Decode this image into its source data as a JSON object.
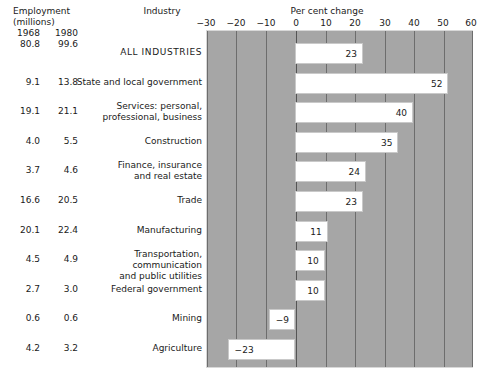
{
  "header": {
    "employment_title": "Employment\n(millions)",
    "industry_title": "Industry",
    "percent_title": "Per cent change",
    "year_a": "1968",
    "year_b": "1980",
    "total_a": "80.8",
    "total_b": "99.6"
  },
  "chart_data": {
    "type": "bar",
    "orientation": "horizontal",
    "title": "Per cent change",
    "xlabel": "Per cent change",
    "ylabel": "Industry",
    "xlim": [
      -30,
      60
    ],
    "xticks": [
      -30,
      -20,
      -10,
      0,
      10,
      20,
      30,
      40,
      50,
      60
    ],
    "xtick_labels": [
      "−30",
      "−20",
      "−10",
      "0",
      "10",
      "20",
      "30",
      "40",
      "50",
      "60"
    ],
    "grid": true,
    "legend": "none",
    "categories": [
      "ALL INDUSTRIES",
      "State and local government",
      "Services: personal,\nprofessional, business",
      "Construction",
      "Finance, insurance\nand real estate",
      "Trade",
      "Manufacturing",
      "Transportation, communication\nand public utilities",
      "Federal government",
      "Mining",
      "Agriculture"
    ],
    "values": [
      23,
      52,
      40,
      35,
      24,
      23,
      11,
      10,
      10,
      -9,
      -23
    ],
    "value_labels": [
      "23",
      "52",
      "40",
      "35",
      "24",
      "23",
      "11",
      "10",
      "10",
      "−9",
      "−23"
    ],
    "employment_1968": [
      "80.8",
      "9.1",
      "19.1",
      "4.0",
      "3.7",
      "16.6",
      "20.1",
      "4.5",
      "2.7",
      "0.6",
      "4.2"
    ],
    "employment_1980": [
      "99.6",
      "13.8",
      "21.1",
      "5.5",
      "4.6",
      "20.5",
      "22.4",
      "4.9",
      "3.0",
      "0.6",
      "3.2"
    ],
    "series_name": "Per cent change in employment 1968–1980",
    "colors": {
      "plot_background": "#a6a6a6",
      "bar_fill": "#ffffff",
      "gridline": "#6d6d6d",
      "text": "#1a1a1a"
    }
  }
}
